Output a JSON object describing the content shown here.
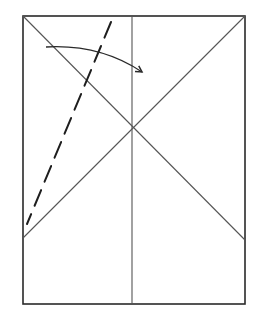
{
  "diagram": {
    "type": "folding-diagram",
    "colors": {
      "background": "#ffffff",
      "outline": "#2a2a2a",
      "crease": "#555555",
      "dash": "#1e1e1e",
      "arrow": "#2a2a2a"
    },
    "rectangle": {
      "x1": 23,
      "y1": 16,
      "x2": 245,
      "y2": 304
    },
    "center_line": {
      "x": 132,
      "y1": 16,
      "y2": 304
    },
    "diagonals": [
      {
        "x1": 23,
        "y1": 16,
        "x2": 245,
        "y2": 240
      },
      {
        "x1": 245,
        "y1": 16,
        "x2": 23,
        "y2": 238
      }
    ],
    "dashed_line": {
      "x1": 111,
      "y1": 22,
      "x2": 27,
      "y2": 224,
      "dash": "17 9"
    },
    "arrow": {
      "start": [
        46,
        47
      ],
      "control": [
        100,
        44
      ],
      "end": [
        142,
        72
      ]
    }
  }
}
